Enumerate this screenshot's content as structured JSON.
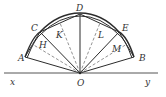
{
  "figure": {
    "colors": {
      "line": "#2b2b2b",
      "dashed": "#777777",
      "label": "#333333"
    },
    "baseline": {
      "start_label": "x",
      "end_label": "y"
    },
    "center": {
      "label": "O"
    },
    "vertices": [
      {
        "label": "A"
      },
      {
        "label": "C"
      },
      {
        "label": "D"
      },
      {
        "label": "E"
      },
      {
        "label": "B"
      }
    ],
    "midpoints": [
      {
        "label": "H",
        "chord": "AC"
      },
      {
        "label": "K",
        "chord": "CD"
      },
      {
        "label": "L",
        "chord": "DE"
      },
      {
        "label": "M",
        "chord": "EB"
      }
    ]
  }
}
